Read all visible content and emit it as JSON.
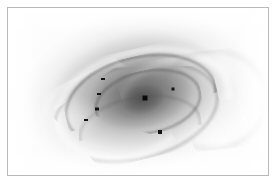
{
  "figure": {
    "caption": "",
    "border_color": "#b9b9b9",
    "plate_background": "#fbfbfb"
  },
  "image": {
    "name": "grayscale-astronomical-plate",
    "subject": "barred spiral galaxy, inverted grayscale",
    "width": 260,
    "height": 167,
    "orientation_deg": -13,
    "nucleus": {
      "x": 137,
      "y": 90,
      "size": 5,
      "color": "#0a0a0a"
    }
  },
  "markers": [
    {
      "name": "marker-arm-north-west",
      "x": 95,
      "y": 71,
      "w": 4,
      "h": 2
    },
    {
      "name": "marker-arm-west-upper",
      "x": 91,
      "y": 86,
      "w": 4,
      "h": 2
    },
    {
      "name": "marker-arm-west-mid",
      "x": 89,
      "y": 101,
      "w": 4,
      "h": 3
    },
    {
      "name": "marker-arm-west-lower",
      "x": 78,
      "y": 112,
      "w": 4,
      "h": 2
    },
    {
      "name": "marker-arm-east-upper",
      "x": 165,
      "y": 81,
      "w": 3,
      "h": 3
    },
    {
      "name": "marker-arm-south-east",
      "x": 152,
      "y": 124,
      "w": 4,
      "h": 4
    }
  ],
  "chart_data": {
    "type": "heatmap",
    "title": "",
    "xlabel": "",
    "ylabel": "",
    "colormap": "grayscale-inverted",
    "intensity_levels": [
      "white (background)",
      "light gray (arm gaps)",
      "mid gray (disc)",
      "dark gray (inner disc / dust lanes)",
      "black (nucleus and point sources)"
    ]
  }
}
